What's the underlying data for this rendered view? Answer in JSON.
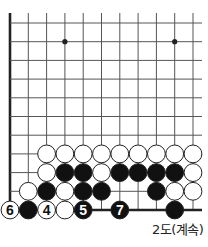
{
  "diagram": {
    "caption": "2도(계속)",
    "grid": {
      "cols": 11,
      "rows": 11,
      "origin_x": 10,
      "origin_y": 23,
      "step_x": 18.3,
      "step_y": 18.7,
      "top_y": 13,
      "right_x": 202,
      "left_edge": true,
      "bottom_edge": true
    },
    "star_points": [
      {
        "col": 3,
        "row": 1
      },
      {
        "col": 9,
        "row": 1
      }
    ],
    "stones": [
      {
        "col": 2,
        "row": 7,
        "color": "white"
      },
      {
        "col": 3,
        "row": 7,
        "color": "white"
      },
      {
        "col": 4,
        "row": 7,
        "color": "white"
      },
      {
        "col": 5,
        "row": 7,
        "color": "white"
      },
      {
        "col": 6,
        "row": 7,
        "color": "white"
      },
      {
        "col": 7,
        "row": 7,
        "color": "white"
      },
      {
        "col": 8,
        "row": 7,
        "color": "white"
      },
      {
        "col": 9,
        "row": 7,
        "color": "white"
      },
      {
        "col": 10,
        "row": 7,
        "color": "white"
      },
      {
        "col": 2,
        "row": 8,
        "color": "white"
      },
      {
        "col": 3,
        "row": 8,
        "color": "black"
      },
      {
        "col": 4,
        "row": 8,
        "color": "black"
      },
      {
        "col": 5,
        "row": 8,
        "color": "white"
      },
      {
        "col": 6,
        "row": 8,
        "color": "black"
      },
      {
        "col": 7,
        "row": 8,
        "color": "black"
      },
      {
        "col": 8,
        "row": 8,
        "color": "black"
      },
      {
        "col": 9,
        "row": 8,
        "color": "black"
      },
      {
        "col": 10,
        "row": 8,
        "color": "white"
      },
      {
        "col": 1,
        "row": 9,
        "color": "white"
      },
      {
        "col": 2,
        "row": 9,
        "color": "black"
      },
      {
        "col": 3,
        "row": 9,
        "color": "white"
      },
      {
        "col": 4,
        "row": 9,
        "color": "black"
      },
      {
        "col": 5,
        "row": 9,
        "color": "black"
      },
      {
        "col": 8,
        "row": 9,
        "color": "black"
      },
      {
        "col": 9,
        "row": 9,
        "color": "white"
      },
      {
        "col": 10,
        "row": 9,
        "color": "white"
      },
      {
        "col": 0,
        "row": 10,
        "color": "white",
        "label": "6"
      },
      {
        "col": 1,
        "row": 10,
        "color": "black"
      },
      {
        "col": 2,
        "row": 10,
        "color": "white",
        "label": "4"
      },
      {
        "col": 3,
        "row": 10,
        "color": "white"
      },
      {
        "col": 4,
        "row": 10,
        "color": "black",
        "label": "5"
      },
      {
        "col": 6,
        "row": 10,
        "color": "black",
        "label": "7"
      },
      {
        "col": 9,
        "row": 10,
        "color": "black"
      }
    ],
    "colors": {
      "line": "#555555",
      "edge": "#222222",
      "black_stone": "#111111",
      "white_stone": "#ffffff",
      "stone_outline": "#222222"
    }
  }
}
